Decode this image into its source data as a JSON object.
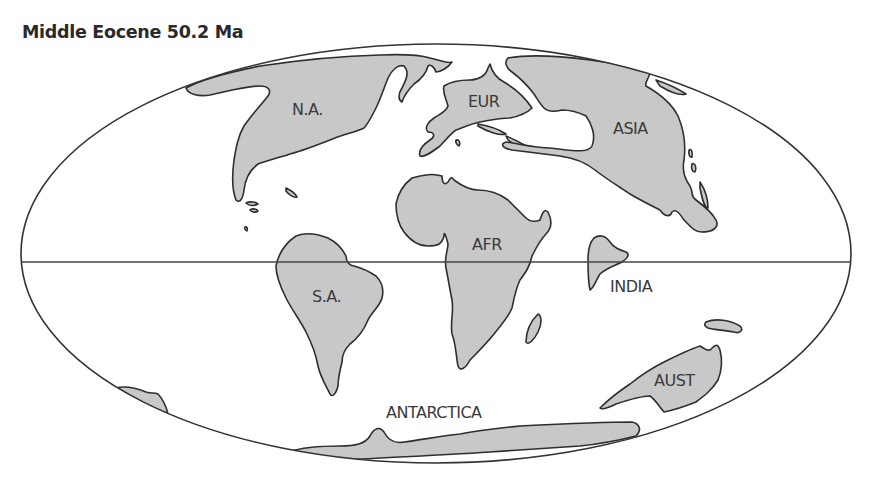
{
  "title": "Middle Eocene 50.2 Ma",
  "map": {
    "projection": "Mollweide (elliptical) world map",
    "outline_color": "#333333",
    "land_fill": "#c8c8c8",
    "labels": {
      "north_america": "N.A.",
      "europe": "EUR",
      "asia": "ASIA",
      "africa": "AFR",
      "south_america": "S.A.",
      "india": "INDIA",
      "australia": "AUST",
      "antarctica": "ANTARCTICA"
    }
  }
}
